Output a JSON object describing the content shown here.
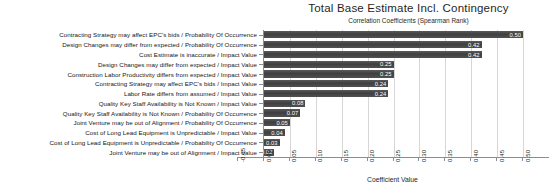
{
  "chart_data": {
    "type": "bar",
    "orientation": "horizontal",
    "title": "Total Base Estimate Incl. Contingency",
    "subtitle": "Correlation Coefficients (Spearman Rank)",
    "xlabel": "Coefficient Value",
    "ylabel": "",
    "xlim": [
      -0.05,
      0.5
    ],
    "grid": true,
    "legend": "none",
    "xticks": [
      "-0.05",
      "0.00",
      "0.05",
      "0.10",
      "0.15",
      "0.20",
      "0.25",
      "0.30",
      "0.35",
      "0.40",
      "0.45",
      "0.50"
    ],
    "xtick_values": [
      -0.05,
      0.0,
      0.05,
      0.1,
      0.15,
      0.2,
      0.25,
      0.3,
      0.35,
      0.4,
      0.45,
      0.5
    ],
    "bar_color": "#474747",
    "categories": [
      "Contracting Strategy may affect EPC's bids / Probability Of Occurrence",
      "Design Changes may differ from expected / Probability Of Occurrence",
      "Cost Estimate is inaccurate / Impact Value",
      "Design Changes may differ from expected / Impact Value",
      "Construction Labor Productivity differs from expected / Impact Value",
      "Contracting Strategy may affect EPC's bids / Impact Value",
      "Labor Rate differs from assumed / Impact Value",
      "Quality Key Staff Availability is Not Known / Impact Value",
      "Quality Key Staff Availability is Not Known / Probability Of Occurrence",
      "Joint Venture may be out of Alignment / Probability Of Occurrence",
      "Cost of Long Lead Equipment is Unpredictable / Impact Value",
      "Cost of Long Lead Equipment is Unpredictable / Probability Of Occurrence",
      "Joint Venture may be out of Alignment / Impact Value"
    ],
    "values": [
      0.5,
      0.42,
      0.42,
      0.25,
      0.25,
      0.24,
      0.24,
      0.08,
      0.07,
      0.05,
      0.04,
      0.03,
      0.02
    ],
    "value_labels": [
      "0.50",
      "0.42",
      "0.42",
      "0.25",
      "0.25",
      "0.24",
      "0.24",
      "0.08",
      "0.07",
      "0.05",
      "0.04",
      "0.03",
      "0.02"
    ]
  }
}
